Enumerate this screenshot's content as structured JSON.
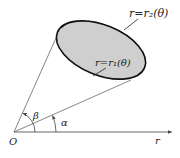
{
  "diagram": {
    "type": "polar-region",
    "origin_label": "O",
    "axis_label": "r",
    "angle_alpha_label": "α",
    "angle_beta_label": "β",
    "outer_curve_label": "r=r₂(θ)",
    "inner_curve_label": "r=r₁(θ)",
    "colors": {
      "region_fill": "#cfcfcf",
      "stroke": "#111111",
      "line": "#555555"
    }
  }
}
